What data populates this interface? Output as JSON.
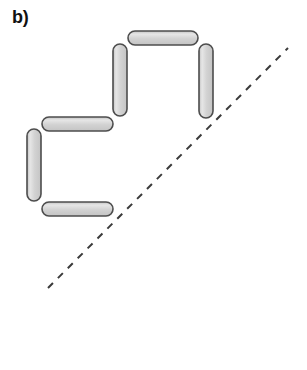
{
  "figure": {
    "panel_label": "b)",
    "width": 307,
    "height": 370,
    "background_color": "#ffffff"
  },
  "style": {
    "bar_fill_light": "#e4e4e4",
    "bar_fill_mid": "#cccccc",
    "bar_fill_dark": "#c2c2c2",
    "bar_stroke_color": "#4d4d4d",
    "bar_stroke_width": 1.6,
    "bar_thickness": 14,
    "bar_corner_radius": 7,
    "dashed_line_color": "#3a3a3a",
    "dashed_line_width": 2,
    "dash_pattern": "7 7"
  },
  "bars": [
    {
      "id": "bar-top-horizontal",
      "name": "top-horizontal-bar",
      "orientation": "horizontal",
      "x": 128,
      "y": 31,
      "width": 70,
      "height": 14
    },
    {
      "id": "bar-upper-left-vertical",
      "name": "upper-left-vertical-bar",
      "orientation": "vertical",
      "x": 113,
      "y": 44,
      "width": 14,
      "height": 72
    },
    {
      "id": "bar-upper-right-vertical",
      "name": "upper-right-vertical-bar",
      "orientation": "vertical",
      "x": 199,
      "y": 44,
      "width": 14,
      "height": 74
    },
    {
      "id": "bar-middle-horizontal",
      "name": "middle-horizontal-bar",
      "orientation": "horizontal",
      "x": 42,
      "y": 117,
      "width": 71,
      "height": 14
    },
    {
      "id": "bar-left-vertical",
      "name": "left-vertical-bar",
      "orientation": "vertical",
      "x": 27,
      "y": 129,
      "width": 14,
      "height": 72
    },
    {
      "id": "bar-bottom-horizontal",
      "name": "bottom-horizontal-bar",
      "orientation": "horizontal",
      "x": 42,
      "y": 202,
      "width": 71,
      "height": 14
    }
  ],
  "dashed_line": {
    "id": "diagonal-dashed-line",
    "name": "diagonal-dashed-line",
    "x1": 48,
    "y1": 288,
    "x2": 288,
    "y2": 48
  }
}
